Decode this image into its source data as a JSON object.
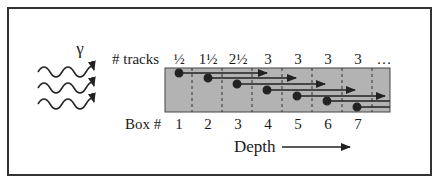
{
  "diagram": {
    "gamma_symbol": "γ",
    "tracks_label": "# tracks",
    "tracks": [
      "½",
      "1½",
      "2½",
      "3",
      "3",
      "3",
      "3",
      "…"
    ],
    "box_label": "Box #",
    "boxes": [
      "1",
      "2",
      "3",
      "4",
      "5",
      "6",
      "7"
    ],
    "depth_label": "Depth",
    "colors": {
      "box_fill": "#b3b3b3",
      "line": "#222222",
      "frame": "#333333",
      "background": "#ffffff"
    }
  }
}
